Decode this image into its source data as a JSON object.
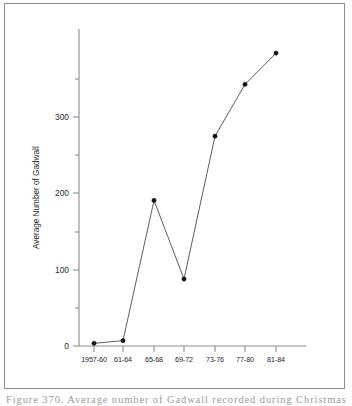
{
  "figure": {
    "caption": "Figure 370.  Average number of Gadwall recorded during Christmas Bird"
  },
  "chart_data": {
    "type": "line",
    "title": "",
    "xlabel": "",
    "ylabel": "Average Number of Gadwall",
    "categories": [
      "1957-60",
      "61-64",
      "65-68",
      "69-72",
      "73-76",
      "77-80",
      "81-84"
    ],
    "values": [
      3,
      6,
      163,
      75,
      235,
      293,
      328
    ],
    "series": [
      {
        "name": "Average Number of Gadwall",
        "values": [
          3,
          6,
          163,
          75,
          235,
          293,
          328
        ]
      }
    ],
    "ylim": [
      0,
      355
    ],
    "yticks": [
      0,
      100,
      200,
      300
    ],
    "ytick_labels": [
      "0",
      "100",
      "200",
      "300"
    ],
    "yticks_minor": [
      50,
      150,
      250,
      350
    ],
    "grid": false,
    "legend": "none",
    "marker": "filled-circle",
    "line_color": "#4a4a4a",
    "marker_color": "#111111",
    "axis_color": "#8e8e8e"
  }
}
